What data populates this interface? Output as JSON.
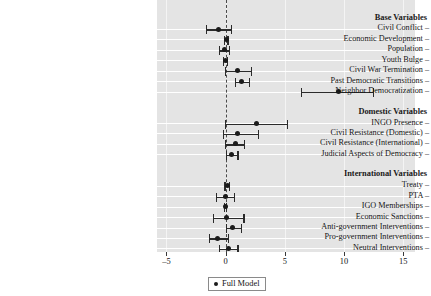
{
  "chart_data": {
    "type": "scatter",
    "title": "",
    "xlabel": "",
    "ylabel": "",
    "xlim": [
      -5.8,
      16.0
    ],
    "xticks": [
      -5,
      0,
      5,
      10,
      15
    ],
    "xticklabels": [
      "-5",
      "0",
      "5",
      "10",
      "15"
    ],
    "grid": true,
    "reference_line": 0,
    "legend_position": "bottom-center",
    "legend": [
      "Full Model"
    ],
    "note": "Coefficient plot with point estimates and confidence intervals grouped into three labeled sections.",
    "sections": [
      {
        "header": "Base Variables",
        "rows": [
          {
            "label": "Civil Conflict",
            "estimate": -0.6,
            "ci_low": -1.6,
            "ci_high": 0.5
          },
          {
            "label": "Economic Development",
            "estimate": 0.05,
            "ci_low": -0.1,
            "ci_high": 0.2
          },
          {
            "label": "Population",
            "estimate": -0.1,
            "ci_low": -0.55,
            "ci_high": 0.3
          },
          {
            "label": "Youth Bulge",
            "estimate": 0.0,
            "ci_low": -0.15,
            "ci_high": 0.15
          },
          {
            "label": "Civil War Termination",
            "estimate": 1.0,
            "ci_low": 0.0,
            "ci_high": 2.2
          },
          {
            "label": "Past Democratic Transitions",
            "estimate": 1.3,
            "ci_low": 0.8,
            "ci_high": 2.0
          },
          {
            "label": "Neighbor Democratization",
            "estimate": 9.5,
            "ci_low": 6.4,
            "ci_high": 12.5
          }
        ]
      },
      {
        "header": "Domestic Variables",
        "rows": [
          {
            "label": "INGO Presence",
            "estimate": 2.6,
            "ci_low": 0.0,
            "ci_high": 5.2
          },
          {
            "label": "Civil Resistance (Domestic)",
            "estimate": 1.0,
            "ci_low": -0.15,
            "ci_high": 2.8
          },
          {
            "label": "Civil Resistance (International)",
            "estimate": 0.85,
            "ci_low": 0.0,
            "ci_high": 1.6
          },
          {
            "label": "Judicial Aspects of Democracy",
            "estimate": 0.5,
            "ci_low": 0.07,
            "ci_high": 1.05
          }
        ]
      },
      {
        "header": "International Variables",
        "rows": [
          {
            "label": "Treaty",
            "estimate": 0.15,
            "ci_low": -0.05,
            "ci_high": 0.35
          },
          {
            "label": "PTA",
            "estimate": 0.0,
            "ci_low": -0.8,
            "ci_high": 0.75
          },
          {
            "label": "IGO Memberships",
            "estimate": 0.0,
            "ci_low": -0.1,
            "ci_high": 0.1
          },
          {
            "label": "Economic Sanctions",
            "estimate": 0.1,
            "ci_low": -1.05,
            "ci_high": 1.55
          },
          {
            "label": "Anti-government Interventions",
            "estimate": 0.6,
            "ci_low": 0.1,
            "ci_high": 1.35
          },
          {
            "label": "Pro-government Interventions",
            "estimate": -0.65,
            "ci_low": -1.35,
            "ci_high": 0.25
          },
          {
            "label": "Neutral Interventions",
            "estimate": 0.2,
            "ci_low": -0.5,
            "ci_high": 1.05
          }
        ]
      }
    ]
  }
}
